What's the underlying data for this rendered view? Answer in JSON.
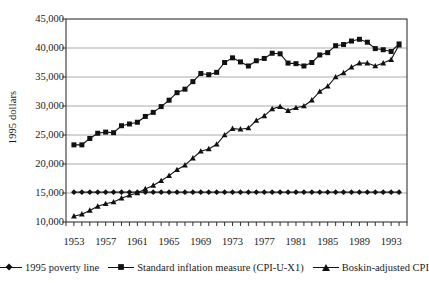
{
  "chart_data": {
    "type": "line",
    "title": "",
    "xlabel": "",
    "ylabel": "1995 dollars",
    "xlim": [
      1952,
      1995
    ],
    "ylim": [
      10000,
      45000
    ],
    "ytick_labels": [
      "45,000",
      "40,000",
      "35,000",
      "30,000",
      "25,000",
      "20,000",
      "15,000",
      "10,000"
    ],
    "ytick_values": [
      45000,
      40000,
      35000,
      30000,
      25000,
      20000,
      15000,
      10000
    ],
    "xtick_labels": [
      "1953",
      "1957",
      "1961",
      "1965",
      "1969",
      "1973",
      "1977",
      "1981",
      "1985",
      "1989",
      "1993"
    ],
    "xtick_values": [
      1953,
      1957,
      1961,
      1965,
      1969,
      1973,
      1977,
      1981,
      1985,
      1989,
      1993
    ],
    "grid": "horizontal",
    "legend_position": "bottom",
    "x": [
      1953,
      1954,
      1955,
      1956,
      1957,
      1958,
      1959,
      1960,
      1961,
      1962,
      1963,
      1964,
      1965,
      1966,
      1967,
      1968,
      1969,
      1970,
      1971,
      1972,
      1973,
      1974,
      1975,
      1976,
      1977,
      1978,
      1979,
      1980,
      1981,
      1982,
      1983,
      1984,
      1985,
      1986,
      1987,
      1988,
      1989,
      1990,
      1991,
      1992,
      1993,
      1994
    ],
    "series": [
      {
        "name": "1995 poverty line",
        "marker": "diamond",
        "values": [
          15150,
          15150,
          15150,
          15150,
          15150,
          15150,
          15150,
          15150,
          15150,
          15150,
          15150,
          15150,
          15150,
          15150,
          15150,
          15150,
          15150,
          15150,
          15150,
          15150,
          15150,
          15150,
          15150,
          15150,
          15150,
          15150,
          15150,
          15150,
          15150,
          15150,
          15150,
          15150,
          15150,
          15150,
          15150,
          15150,
          15150,
          15150,
          15150,
          15150,
          15150,
          15150
        ]
      },
      {
        "name": "Standard inflation measure (CPI-U-X1)",
        "marker": "square",
        "values": [
          23300,
          23300,
          24400,
          25300,
          25500,
          25400,
          26600,
          26900,
          27200,
          28200,
          28900,
          29900,
          31000,
          32300,
          32900,
          34200,
          35600,
          35400,
          35800,
          37500,
          38300,
          37600,
          36900,
          37800,
          38200,
          39100,
          39000,
          37400,
          37300,
          36900,
          37500,
          38800,
          39200,
          40400,
          40600,
          41200,
          41500,
          41000,
          39900,
          39700,
          39400,
          40700
        ]
      },
      {
        "name": "Boskin-adjusted CPI",
        "marker": "triangle",
        "values": [
          11000,
          11350,
          12000,
          12700,
          13150,
          13450,
          14100,
          14600,
          15000,
          15700,
          16300,
          17100,
          18000,
          19000,
          19800,
          21000,
          22200,
          22600,
          23400,
          25000,
          26100,
          26000,
          26200,
          27500,
          28300,
          29500,
          29900,
          29200,
          29700,
          30000,
          31000,
          32500,
          33400,
          35000,
          35700,
          36700,
          37400,
          37400,
          36900,
          37400,
          38000,
          40500
        ]
      }
    ],
    "colors": {
      "line": "#111111",
      "grid": "#aaaaaa",
      "axis": "#333333",
      "text": "#1a1a1a"
    }
  }
}
